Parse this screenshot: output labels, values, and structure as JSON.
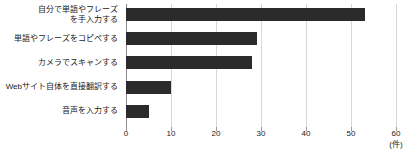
{
  "chart_data": {
    "type": "bar",
    "orientation": "horizontal",
    "title": "",
    "xlabel": "",
    "ylabel": "",
    "unit_label": "(件)",
    "xlim": [
      0,
      60
    ],
    "xticks": [
      0,
      10,
      20,
      30,
      40,
      50,
      60
    ],
    "xtick_labels": [
      "0",
      "10",
      "20",
      "30",
      "40",
      "50",
      "60"
    ],
    "grid": true,
    "grid_axis": "x",
    "legend": false,
    "bar_color": "#2b2b2b",
    "grid_color": "#d8d8d8",
    "axis_color": "#8a8a8a",
    "categories": [
      "自分で単語やフレーズ\nを手入力する",
      "単語やフレーズをコピペする",
      "カメラでスキャンする",
      "Webサイト自体を直接翻訳する",
      "音声を入力する"
    ],
    "values": [
      53,
      29,
      28,
      10,
      5
    ]
  }
}
